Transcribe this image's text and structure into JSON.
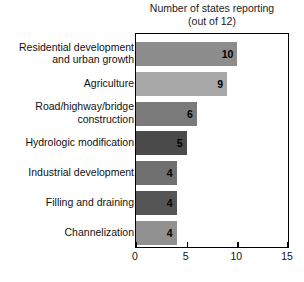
{
  "chart_data": {
    "type": "bar",
    "orientation": "horizontal",
    "title": "Number of states reporting",
    "subtitle": "(out of 12)",
    "xlabel": "",
    "ylabel": "",
    "xlim": [
      0,
      15
    ],
    "xticks": [
      0,
      5,
      10,
      15
    ],
    "grid": false,
    "legend": "none",
    "categories": [
      "Residential development and urban growth",
      "Agriculture",
      "Road/highway/bridge construction",
      "Hydrologic modification",
      "Industrial development",
      "Filling and draining",
      "Channelization"
    ],
    "values": [
      10,
      9,
      6,
      5,
      4,
      4,
      4
    ],
    "bar_colors": [
      "#8c8c8c",
      "#a8a8a8",
      "#7a7a7a",
      "#4a4a4a",
      "#707070",
      "#555555",
      "#909090"
    ]
  },
  "bars": [
    {
      "label_lines": [
        "Residential development",
        "and urban growth"
      ],
      "value": 10,
      "value_text": "10",
      "color": "#8c8c8c"
    },
    {
      "label_lines": [
        "Agriculture"
      ],
      "value": 9,
      "value_text": "9",
      "color": "#a8a8a8"
    },
    {
      "label_lines": [
        "Road/highway/bridge",
        "construction"
      ],
      "value": 6,
      "value_text": "6",
      "color": "#7a7a7a"
    },
    {
      "label_lines": [
        "Hydrologic modification"
      ],
      "value": 5,
      "value_text": "5",
      "color": "#4a4a4a"
    },
    {
      "label_lines": [
        "Industrial development"
      ],
      "value": 4,
      "value_text": "4",
      "color": "#707070"
    },
    {
      "label_lines": [
        "Filling and draining"
      ],
      "value": 4,
      "value_text": "4",
      "color": "#555555"
    },
    {
      "label_lines": [
        "Channelization"
      ],
      "value": 4,
      "value_text": "4",
      "color": "#909090"
    }
  ],
  "axis": {
    "ticks": [
      {
        "value": 0,
        "label": "0"
      },
      {
        "value": 5,
        "label": "5"
      },
      {
        "value": 10,
        "label": "10"
      },
      {
        "value": 15,
        "label": "15"
      }
    ]
  }
}
